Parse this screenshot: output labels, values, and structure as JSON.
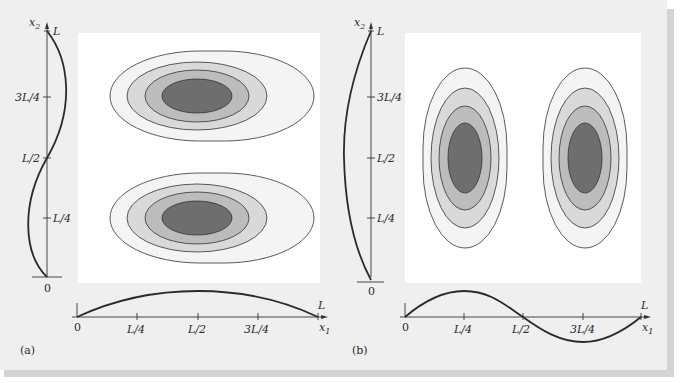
{
  "figure": {
    "background_color": "#efefef",
    "plot_background_color": "#ffffff",
    "shadow_color": "#d6d6d6",
    "contour_fills": [
      "#f4f4f4",
      "#d9d9d9",
      "#bcbcbc",
      "#6e6e6e"
    ],
    "contour_stroke": "#333333",
    "curve_color": "#2a2a2a"
  },
  "panels": [
    {
      "id": "a",
      "caption": "(a)",
      "y_axis": {
        "label": "x",
        "label_sub": "2",
        "end_label": "L",
        "origin_label": "0",
        "ticks": [
          "3L/4",
          "L/2",
          "L/4"
        ],
        "mode_shape": "sin(2πx₂/L)"
      },
      "x_axis": {
        "label": "x",
        "label_sub": "1",
        "end_label": "L",
        "origin_label": "0",
        "ticks": [
          "L/4",
          "L/2",
          "3L/4"
        ],
        "mode_shape": "sin(πx₁/L)"
      },
      "contours": {
        "lobes": 2,
        "arrangement": "stacked vertically",
        "levels": 4
      }
    },
    {
      "id": "b",
      "caption": "(b)",
      "y_axis": {
        "label": "x",
        "label_sub": "2",
        "end_label": "L",
        "origin_label": "0",
        "ticks": [
          "3L/4",
          "L/2",
          "L/4"
        ],
        "mode_shape": "sin(πx₂/L)"
      },
      "x_axis": {
        "label": "x",
        "label_sub": "1",
        "end_label": "L",
        "origin_label": "0",
        "ticks": [
          "L/4",
          "L/2",
          "3L/4"
        ],
        "mode_shape": "sin(2πx₁/L)"
      },
      "contours": {
        "lobes": 2,
        "arrangement": "side by side",
        "levels": 4
      }
    }
  ]
}
